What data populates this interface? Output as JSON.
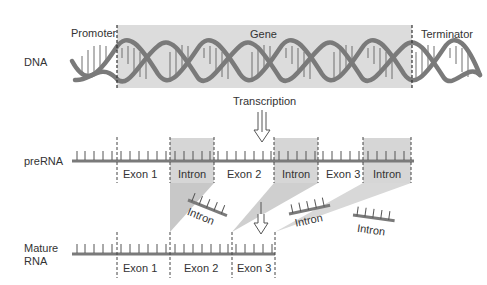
{
  "dna": {
    "row_label": "DNA",
    "promoter_label": "Promoter",
    "gene_label": "Gene",
    "terminator_label": "Terminator"
  },
  "transcription": {
    "label": "Transcription"
  },
  "prerna": {
    "row_label": "preRNA",
    "segments": [
      {
        "label": "Exon 1",
        "type": "exon"
      },
      {
        "label": "Intron",
        "type": "intron"
      },
      {
        "label": "Exon 2",
        "type": "exon"
      },
      {
        "label": "Intron",
        "type": "intron"
      },
      {
        "label": "Exon 3",
        "type": "exon"
      },
      {
        "label": "Intron",
        "type": "intron"
      }
    ]
  },
  "excised_introns": [
    {
      "label": "Intron"
    },
    {
      "label": "Intron"
    },
    {
      "label": "Intron"
    }
  ],
  "mature_rna": {
    "row_label_line1": "Mature",
    "row_label_line2": "RNA",
    "segments": [
      {
        "label": "Exon 1"
      },
      {
        "label": "Exon 2"
      },
      {
        "label": "Exon 3"
      }
    ]
  },
  "colors": {
    "strand": "#7a7a7a",
    "gene_box": "#dcdcdc",
    "intron_box": "#d6d6d6",
    "splice_wedge": "#c8c8c8",
    "text": "#333333"
  }
}
